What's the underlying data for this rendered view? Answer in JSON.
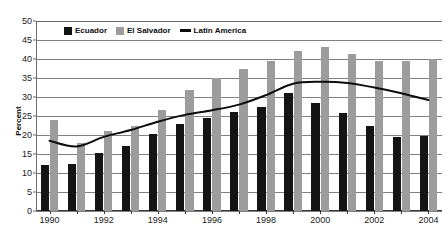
{
  "chart_data": {
    "type": "bar",
    "title": "",
    "xlabel": "",
    "ylabel": "Percent",
    "ylim": [
      0,
      50
    ],
    "ytick_step": 5,
    "yticks": [
      0,
      5,
      10,
      15,
      20,
      25,
      30,
      35,
      40,
      45,
      50
    ],
    "grid": true,
    "legend_position": "top-left-inside",
    "categories": [
      "1990",
      "1991",
      "1992",
      "1993",
      "1994",
      "1995",
      "1996",
      "1997",
      "1998",
      "1999",
      "2000",
      "2001",
      "2002",
      "2003",
      "2004"
    ],
    "xtick_labels": [
      "1990",
      "1992",
      "1994",
      "1996",
      "1998",
      "2000",
      "2002",
      "2004"
    ],
    "series": [
      {
        "name": "Ecuador",
        "type": "bar",
        "color": "#141414",
        "values": [
          12.0,
          12.5,
          15.3,
          17.2,
          20.3,
          23.0,
          24.5,
          26.0,
          27.5,
          31.0,
          28.5,
          25.8,
          22.3,
          19.5,
          19.8
        ]
      },
      {
        "name": "El Salvador",
        "type": "bar",
        "color": "#9c9c9c",
        "values": [
          24.0,
          18.0,
          21.0,
          22.5,
          26.5,
          31.8,
          35.0,
          37.5,
          39.5,
          42.0,
          43.2,
          41.3,
          39.5,
          39.5,
          40.0
        ]
      },
      {
        "name": "Latin America",
        "type": "line",
        "color": "#0d0d0d",
        "values": [
          18.5,
          17.0,
          19.5,
          21.3,
          23.5,
          25.3,
          26.5,
          28.0,
          30.5,
          33.5,
          34.0,
          33.7,
          32.5,
          31.0,
          29.2
        ]
      }
    ]
  },
  "legend": {
    "items": [
      {
        "label": "Ecuador",
        "marker": "square",
        "color": "#141414"
      },
      {
        "label": "El Salvador",
        "marker": "square",
        "color": "#9c9c9c"
      },
      {
        "label": "Latin America",
        "marker": "line",
        "color": "#0d0d0d"
      }
    ]
  },
  "axes": {
    "y_title": "Percent"
  }
}
